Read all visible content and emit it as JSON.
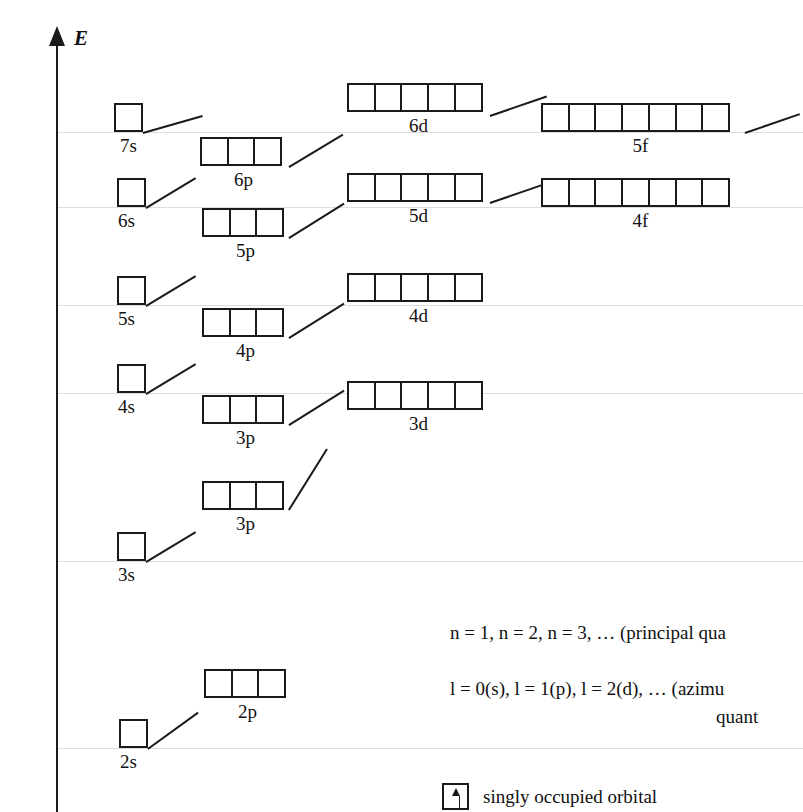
{
  "axis": {
    "symbol": "E",
    "caption": "energy of the electronic system (approximation)"
  },
  "diagram": {
    "orbitals": [
      {
        "id": "7s",
        "label": "7s",
        "cells": 1,
        "type": "s"
      },
      {
        "id": "6p",
        "label": "6p",
        "cells": 3,
        "type": "p"
      },
      {
        "id": "6d",
        "label": "6d",
        "cells": 5,
        "type": "d"
      },
      {
        "id": "5f",
        "label": "5f",
        "cells": 7,
        "type": "f"
      },
      {
        "id": "6s",
        "label": "6s",
        "cells": 1,
        "type": "s"
      },
      {
        "id": "5p",
        "label": "5p",
        "cells": 3,
        "type": "p"
      },
      {
        "id": "5d",
        "label": "5d",
        "cells": 5,
        "type": "d"
      },
      {
        "id": "4f",
        "label": "4f",
        "cells": 7,
        "type": "f"
      },
      {
        "id": "5s",
        "label": "5s",
        "cells": 1,
        "type": "s"
      },
      {
        "id": "4p",
        "label": "4p",
        "cells": 3,
        "type": "p"
      },
      {
        "id": "4d",
        "label": "4d",
        "cells": 5,
        "type": "d"
      },
      {
        "id": "4s",
        "label": "4s",
        "cells": 1,
        "type": "s"
      },
      {
        "id": "3p",
        "label": "3p",
        "cells": 3,
        "type": "p"
      },
      {
        "id": "3d",
        "label": "3d",
        "cells": 5,
        "type": "d"
      },
      {
        "id": "3s",
        "label": "3s",
        "cells": 1,
        "type": "s"
      },
      {
        "id": "2p",
        "label": "2p",
        "cells": 3,
        "type": "p"
      },
      {
        "id": "2s",
        "label": "2s",
        "cells": 1,
        "type": "s"
      }
    ]
  },
  "notes": {
    "principal": "n = 1, n = 2, n = 3, …  (principal qua",
    "azimuthal": "l = 0(s), l = 1(p), l = 2(d), …  (azimu",
    "azimuthal_second_line": "quant"
  },
  "legend": {
    "items": [
      {
        "icon": "single-up-arrow-box",
        "text": "singly occupied orbital"
      }
    ]
  },
  "colors": {
    "ink": "#1a1a1a",
    "gridline": "#dedede",
    "background": "#ffffff"
  }
}
